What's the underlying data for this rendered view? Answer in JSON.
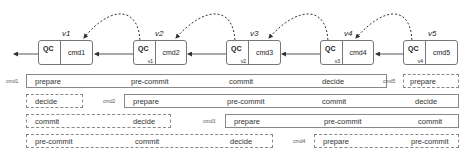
{
  "chain": {
    "blocks": [
      {
        "version": "v1",
        "qc": "QC",
        "qc_ref": "",
        "cmd": "cmd1"
      },
      {
        "version": "v2",
        "qc": "QC",
        "qc_ref": "v1",
        "cmd": "cmd2"
      },
      {
        "version": "v3",
        "qc": "QC",
        "qc_ref": "v2",
        "cmd": "cmd3"
      },
      {
        "version": "v4",
        "qc": "QC",
        "qc_ref": "v3",
        "cmd": "cmd4"
      },
      {
        "version": "v5",
        "qc": "QC",
        "qc_ref": "v4",
        "cmd": "cmd5"
      }
    ]
  },
  "pipeline": {
    "rows": [
      {
        "label": "cmd1",
        "phases": [
          "prepare",
          "pre-commit",
          "commit",
          "decide"
        ]
      },
      {
        "label": "cmd2",
        "phases": [
          "prepare",
          "pre-commit",
          "commit",
          "decide"
        ],
        "wrap": [
          "decide"
        ]
      },
      {
        "label": "cmd3",
        "phases": [
          "prepare",
          "pre-commit",
          "commit",
          "decide"
        ],
        "wrap": [
          "commit",
          "decide"
        ]
      },
      {
        "label": "cmd4",
        "phases": [
          "prepare",
          "pre-commit",
          "commit",
          "decide"
        ],
        "wrap": [
          "pre-commit",
          "commit",
          "decide"
        ]
      },
      {
        "label": "cmd5",
        "phases": [
          "prepare"
        ]
      }
    ],
    "wrap_right": {
      "row2": "decide",
      "row3": "commit",
      "row4": "pre-commit"
    }
  }
}
